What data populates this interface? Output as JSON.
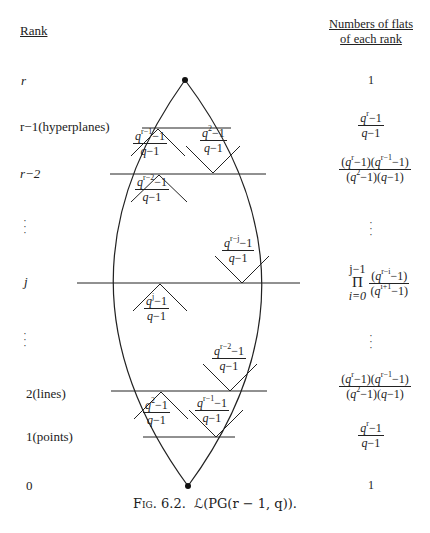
{
  "headers": {
    "rank": "Rank",
    "numbers_line1": "Numbers of flats",
    "numbers_line2": "of each rank"
  },
  "ranks": [
    {
      "label": "r",
      "count": "1"
    },
    {
      "label": "r−1(hyperplanes)",
      "count_num": "q^r−1",
      "count_den": "q−1"
    },
    {
      "label": "r−2",
      "count_num": "(q^r−1)(q^(r−1)−1)",
      "count_den": "(q^2−1)(q−1)"
    },
    {
      "label": "⋮",
      "count": "⋮"
    },
    {
      "label": "j",
      "count": "∏_{i=0}^{j−1} (q^(r−i)−1)/(q^(i+1)−1)"
    },
    {
      "label": "⋮",
      "count": "⋮"
    },
    {
      "label": "2(lines)",
      "count_num": "(q^r−1)(q^(r−1)−1)",
      "count_den": "(q^2−1)(q−1)"
    },
    {
      "label": "1(points)",
      "count_num": "q^r−1",
      "count_den": "q−1"
    },
    {
      "label": "0",
      "count": "1"
    }
  ],
  "labels": {
    "r": "r",
    "r1": "r−1(hyperplanes)",
    "r2": "r−2",
    "j": "j",
    "two": "2(lines)",
    "one": "1(points)",
    "zero": "0",
    "dots": "· · ·"
  },
  "counts": {
    "one_top": "1",
    "one_bottom": "1",
    "q": "q",
    "minus1": "−1",
    "qm1": "q−1",
    "lp": "(",
    "rp": ")",
    "prod_top": "j−1",
    "prod_sym": "Π",
    "prod_bot": "i=0"
  },
  "triangles": [
    {
      "pos": "r-1 left up",
      "num_exp": "r−1",
      "den": "q−1"
    },
    {
      "pos": "r-1 right down",
      "num_exp": "2",
      "den": "q−1"
    },
    {
      "pos": "r-2 up",
      "num_exp": "r−2",
      "den": "q−1"
    },
    {
      "pos": "j down",
      "num_exp": "r−j",
      "den": "q−1"
    },
    {
      "pos": "j up",
      "num_exp": "j",
      "den": "q−1"
    },
    {
      "pos": "2 down",
      "num_exp": "r−2",
      "den": "q−1"
    },
    {
      "pos": "1 left up",
      "num_exp": "2",
      "den": "q−1"
    },
    {
      "pos": "1 right down",
      "num_exp": "r−1",
      "den": "q−1"
    }
  ],
  "exp": {
    "r": "r",
    "r1": "r−1",
    "r2": "r−2",
    "rj": "r−j",
    "j": "j",
    "two": "2",
    "ri": "r−i",
    "i1": "i+1"
  },
  "caption": {
    "fig": "Fig. 6.2.",
    "text": "ℒ(PG(r − 1, q))."
  }
}
